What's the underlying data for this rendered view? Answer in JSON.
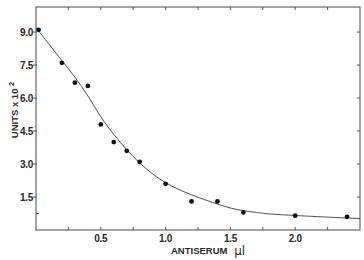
{
  "chart_data": {
    "type": "scatter",
    "title": "",
    "xlabel": "ANTISERUM μl",
    "ylabel": "UNITS x 10²",
    "xlim": [
      0,
      2.5
    ],
    "ylim": [
      0,
      10.14
    ],
    "grid": false,
    "legend": null,
    "frame": "boxed, ticks on all four sides",
    "x_ticks": [
      0.5,
      1.0,
      1.5,
      2.0
    ],
    "x_tick_labels": [
      "0.5",
      "1.0",
      "1.5",
      "2.0"
    ],
    "x_minor_ticks": [
      0.25,
      0.75,
      1.25,
      1.75,
      2.25
    ],
    "y_ticks": [
      1.5,
      3.0,
      4.5,
      6.0,
      7.5,
      9.0
    ],
    "y_tick_labels": [
      "1.5",
      "3.0",
      "4.5",
      "6.0",
      "7.5",
      "9.0"
    ],
    "y_minor_ticks": [
      0.75
    ],
    "series": [
      {
        "name": "measured points",
        "type": "scatter",
        "x": [
          0.02,
          0.2,
          0.3,
          0.4,
          0.5,
          0.6,
          0.7,
          0.8,
          1.0,
          1.2,
          1.4,
          1.6,
          2.0,
          2.4
        ],
        "y": [
          9.1,
          7.6,
          6.7,
          6.55,
          4.8,
          4.0,
          3.6,
          3.1,
          2.1,
          1.3,
          1.3,
          0.8,
          0.65,
          0.6
        ]
      },
      {
        "name": "fitted curve",
        "type": "line",
        "x": [
          0,
          0.1,
          0.2,
          0.3,
          0.4,
          0.5,
          0.6,
          0.7,
          0.8,
          0.9,
          1.0,
          1.1,
          1.2,
          1.3,
          1.4,
          1.5,
          1.6,
          1.7,
          1.8,
          2.0,
          2.2,
          2.5
        ],
        "y": [
          9.2,
          8.45,
          7.7,
          6.95,
          6.1,
          5.15,
          4.35,
          3.65,
          3.05,
          2.55,
          2.15,
          1.85,
          1.6,
          1.38,
          1.18,
          1.0,
          0.88,
          0.8,
          0.73,
          0.66,
          0.6,
          0.52
        ]
      }
    ]
  },
  "axes": {
    "x_title": "ANTISERUM",
    "x_unit": "μl",
    "y_title": "UNITS x 10",
    "y_exponent": "2"
  },
  "colors": {
    "background": "#ffffff",
    "axis": "#4a4a4a",
    "points": "#111111",
    "curve": "#3c3c3c",
    "text": "#2a2a2a"
  }
}
